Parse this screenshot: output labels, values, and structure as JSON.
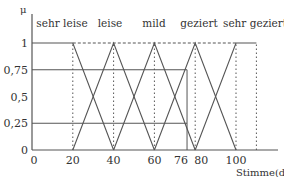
{
  "chart_data": {
    "type": "line",
    "title": "",
    "xlabel": "Stimme(dB)",
    "ylabel": "μ",
    "xlim": [
      0,
      110
    ],
    "ylim": [
      0,
      1
    ],
    "x_ticks": [
      {
        "value": 0,
        "label": "0"
      },
      {
        "value": 20,
        "label": "20"
      },
      {
        "value": 40,
        "label": "40"
      },
      {
        "value": 60,
        "label": "60"
      },
      {
        "value": 76,
        "label": "76"
      },
      {
        "value": 80,
        "label": "80"
      },
      {
        "value": 100,
        "label": "100"
      }
    ],
    "y_ticks": [
      {
        "value": 0,
        "label": "0"
      },
      {
        "value": 0.25,
        "label": "0,25"
      },
      {
        "value": 0.5,
        "label": "0,5"
      },
      {
        "value": 0.75,
        "label": "0,75"
      },
      {
        "value": 1,
        "label": "1"
      }
    ],
    "series": [
      {
        "name": "sehr leise",
        "x": [
          0,
          20,
          40
        ],
        "y": [
          1,
          1,
          0
        ]
      },
      {
        "name": "leise",
        "x": [
          20,
          40,
          60
        ],
        "y": [
          0,
          1,
          0
        ]
      },
      {
        "name": "mild",
        "x": [
          40,
          60,
          80
        ],
        "y": [
          0,
          1,
          0
        ]
      },
      {
        "name": "geziert",
        "x": [
          60,
          80,
          100
        ],
        "y": [
          0,
          1,
          0
        ]
      },
      {
        "name": "sehr geziert",
        "x": [
          80,
          100,
          110
        ],
        "y": [
          0,
          1,
          1
        ]
      }
    ],
    "reference_lines": [
      {
        "type": "horizontal",
        "y": 1,
        "x_range": [
          20,
          100
        ],
        "style": "dashed"
      },
      {
        "type": "horizontal",
        "y": 0.75,
        "x_range": [
          0,
          76
        ],
        "style": "solid"
      },
      {
        "type": "horizontal",
        "y": 0.25,
        "x_range": [
          0,
          76
        ],
        "style": "solid"
      },
      {
        "type": "vertical",
        "x": 76,
        "y_range": [
          0,
          0.75
        ],
        "style": "solid"
      },
      {
        "type": "vertical",
        "x": 20,
        "style": "dotted"
      },
      {
        "type": "vertical",
        "x": 40,
        "style": "dotted"
      },
      {
        "type": "vertical",
        "x": 60,
        "style": "dotted"
      },
      {
        "type": "vertical",
        "x": 80,
        "style": "dotted"
      },
      {
        "type": "vertical",
        "x": 100,
        "style": "dotted"
      },
      {
        "type": "vertical",
        "x": 110,
        "style": "dotted"
      }
    ],
    "legend": [
      "sehr leise",
      "leise",
      "mild",
      "geziert",
      "sehr geziert"
    ],
    "legend_position": "top (labels above each peak)",
    "grid": false
  }
}
